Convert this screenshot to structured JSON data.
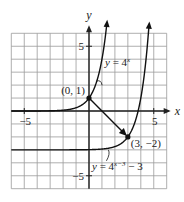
{
  "chart_data": {
    "type": "line",
    "title": "",
    "xlabel": "x",
    "ylabel": "y",
    "xlim": [
      -6,
      6
    ],
    "ylim": [
      -6,
      6
    ],
    "grid": true,
    "x_ticks": [
      {
        "value": -5,
        "label": "−5"
      },
      {
        "value": 5,
        "label": "5"
      }
    ],
    "y_ticks": [
      {
        "value": 5,
        "label": "5"
      },
      {
        "value": -5,
        "label": "−5"
      }
    ],
    "series": [
      {
        "name": "y = 4^x",
        "label": "y = 4",
        "exponent": "x",
        "function": "4^x",
        "asymptote": 0
      },
      {
        "name": "y = 4^(x−3) − 3",
        "label": "y = 4",
        "exponent": "x−3",
        "suffix": " − 3",
        "function": "4^(x-3)-3",
        "asymptote": -3
      }
    ],
    "points": [
      {
        "x": 0,
        "y": 1,
        "label": "(0, 1)"
      },
      {
        "x": 3,
        "y": -2,
        "label": "(3, −2)"
      }
    ],
    "annotations": [
      {
        "type": "arrow",
        "from": [
          0,
          1
        ],
        "to": [
          3,
          -2
        ],
        "text": "translation"
      }
    ]
  }
}
